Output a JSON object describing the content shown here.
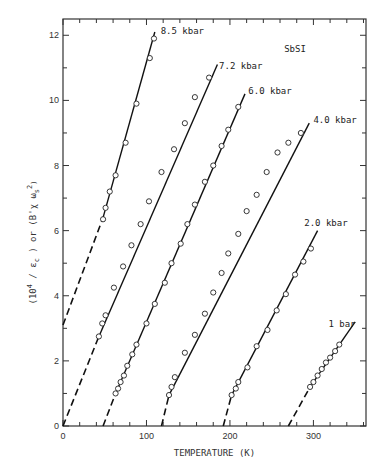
{
  "chart_data": {
    "type": "line",
    "title": "",
    "annotation": "SbSI",
    "xlabel": "TEMPERATURE (K)",
    "ylabel": "(10^4 / ε_c) or (B'χ ω_s^2)",
    "xlim": [
      0,
      363
    ],
    "ylim": [
      0,
      12.5
    ],
    "x_ticks": [
      0,
      100,
      200,
      300
    ],
    "x_minor_step": 20,
    "y_ticks": [
      0,
      2,
      4,
      6,
      8,
      10,
      12
    ],
    "y_minor_step": 1,
    "grid": false,
    "series": [
      {
        "name": "8.5 kbar",
        "dashed_segment": [
          [
            0,
            3.1
          ],
          [
            48,
            6.4
          ]
        ],
        "solid_segment": [
          [
            48,
            6.4
          ],
          [
            110,
            12.1
          ]
        ],
        "points": [
          [
            48,
            6.35
          ],
          [
            51,
            6.7
          ],
          [
            56,
            7.2
          ],
          [
            63,
            7.7
          ],
          [
            75,
            8.7
          ],
          [
            88,
            9.9
          ],
          [
            104,
            11.3
          ],
          [
            109,
            11.9
          ]
        ]
      },
      {
        "name": "7.2 kbar",
        "dashed_segment": [
          [
            0,
            0
          ],
          [
            43,
            2.75
          ]
        ],
        "solid_segment": [
          [
            43,
            2.75
          ],
          [
            185,
            11.1
          ]
        ],
        "points": [
          [
            43,
            2.75
          ],
          [
            47,
            3.15
          ],
          [
            51,
            3.4
          ],
          [
            61,
            4.25
          ],
          [
            72,
            4.9
          ],
          [
            82,
            5.55
          ],
          [
            93,
            6.2
          ],
          [
            103,
            6.9
          ],
          [
            118,
            7.8
          ],
          [
            133,
            8.5
          ],
          [
            146,
            9.3
          ],
          [
            158,
            10.1
          ],
          [
            175,
            10.7
          ]
        ]
      },
      {
        "name": "6.0 kbar",
        "dashed_segment": [
          [
            48,
            0
          ],
          [
            63,
            1.0
          ]
        ],
        "solid_segment": [
          [
            63,
            1.0
          ],
          [
            218,
            10.2
          ]
        ],
        "points": [
          [
            63,
            1.0
          ],
          [
            66,
            1.15
          ],
          [
            69,
            1.35
          ],
          [
            73,
            1.55
          ],
          [
            77,
            1.85
          ],
          [
            83,
            2.2
          ],
          [
            88,
            2.5
          ],
          [
            100,
            3.15
          ],
          [
            110,
            3.75
          ],
          [
            122,
            4.4
          ],
          [
            130,
            5.0
          ],
          [
            141,
            5.6
          ],
          [
            149,
            6.2
          ],
          [
            158,
            6.8
          ],
          [
            170,
            7.5
          ],
          [
            180,
            8.0
          ],
          [
            190,
            8.6
          ],
          [
            198,
            9.1
          ],
          [
            210,
            9.8
          ]
        ]
      },
      {
        "name": "4.0 kbar",
        "dashed_segment": [
          [
            118,
            0
          ],
          [
            127,
            0.95
          ]
        ],
        "solid_segment": [
          [
            127,
            0.95
          ],
          [
            295,
            9.3
          ]
        ],
        "points": [
          [
            127,
            0.95
          ],
          [
            130,
            1.2
          ],
          [
            134,
            1.5
          ],
          [
            146,
            2.25
          ],
          [
            158,
            2.8
          ],
          [
            170,
            3.45
          ],
          [
            180,
            4.1
          ],
          [
            190,
            4.7
          ],
          [
            198,
            5.3
          ],
          [
            210,
            5.9
          ],
          [
            220,
            6.6
          ],
          [
            232,
            7.1
          ],
          [
            244,
            7.8
          ],
          [
            257,
            8.4
          ],
          [
            270,
            8.7
          ],
          [
            285,
            9.0
          ]
        ]
      },
      {
        "name": "2.0 kbar",
        "dashed_segment": [
          [
            192,
            0
          ],
          [
            202,
            0.95
          ]
        ],
        "solid_segment": [
          [
            202,
            0.95
          ],
          [
            305,
            6.0
          ]
        ],
        "points": [
          [
            202,
            0.95
          ],
          [
            207,
            1.15
          ],
          [
            210,
            1.35
          ],
          [
            221,
            1.8
          ],
          [
            232,
            2.45
          ],
          [
            245,
            2.95
          ],
          [
            256,
            3.55
          ],
          [
            267,
            4.05
          ],
          [
            278,
            4.65
          ],
          [
            288,
            5.05
          ],
          [
            297,
            5.45
          ]
        ]
      },
      {
        "name": "1 bar",
        "dashed_segment": [
          [
            270,
            0
          ],
          [
            296,
            1.2
          ]
        ],
        "solid_segment": [
          [
            296,
            1.2
          ],
          [
            350,
            3.2
          ]
        ],
        "points": [
          [
            296,
            1.2
          ],
          [
            300,
            1.35
          ],
          [
            305,
            1.55
          ],
          [
            310,
            1.75
          ],
          [
            315,
            1.95
          ],
          [
            320,
            2.1
          ],
          [
            326,
            2.3
          ],
          [
            331,
            2.5
          ]
        ]
      }
    ],
    "series_labels": [
      {
        "series": "8.5 kbar",
        "text": "8.5 kbar",
        "at": [
          117,
          12.05
        ]
      },
      {
        "series": "7.2 kbar",
        "text": "7.2 kbar",
        "at": [
          187,
          10.95
        ]
      },
      {
        "series": "6.0 kbar",
        "text": "6.0 kbar",
        "at": [
          222,
          10.2
        ]
      },
      {
        "series": "4.0 kbar",
        "text": "4.0 kbar",
        "at": [
          300,
          9.3
        ]
      },
      {
        "series": "2.0 kbar",
        "text": "2.0 kbar",
        "at": [
          289,
          6.15
        ]
      },
      {
        "series": "1 bar",
        "text": "1 bar",
        "at": [
          318,
          3.05
        ]
      }
    ],
    "annotation_at": [
      265,
      11.5
    ]
  }
}
